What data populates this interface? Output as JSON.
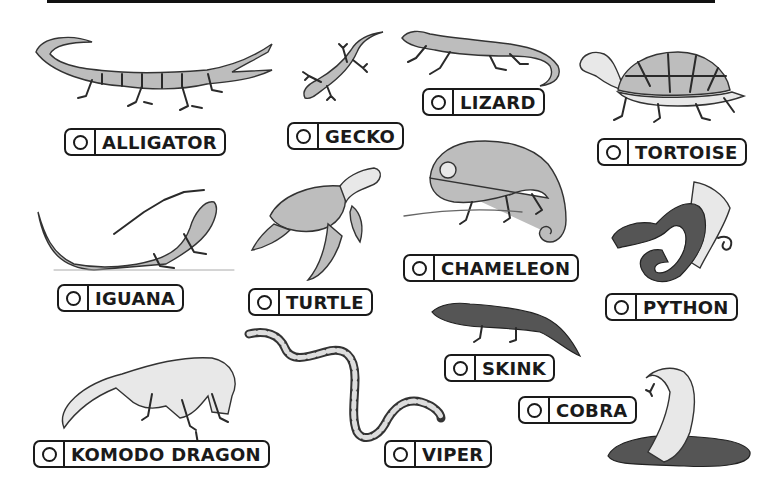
{
  "worksheet": {
    "labels": [
      {
        "id": "alligator",
        "text": "ALLIGATOR",
        "checked": false
      },
      {
        "id": "gecko",
        "text": "GECKO",
        "checked": false
      },
      {
        "id": "lizard",
        "text": "LIZARD",
        "checked": false
      },
      {
        "id": "tortoise",
        "text": "TORTOISE",
        "checked": false
      },
      {
        "id": "chameleon",
        "text": "CHAMELEON",
        "checked": false
      },
      {
        "id": "iguana",
        "text": "IGUANA",
        "checked": false
      },
      {
        "id": "turtle",
        "text": "TURTLE",
        "checked": false
      },
      {
        "id": "python",
        "text": "PYTHON",
        "checked": false
      },
      {
        "id": "skink",
        "text": "SKINK",
        "checked": false
      },
      {
        "id": "cobra",
        "text": "COBRA",
        "checked": false
      },
      {
        "id": "komodo-dragon",
        "text": "KOMODO DRAGON",
        "checked": false
      },
      {
        "id": "viper",
        "text": "VIPER",
        "checked": false
      }
    ],
    "illustrations": [
      "alligator",
      "gecko",
      "lizard",
      "tortoise",
      "iguana",
      "turtle",
      "chameleon",
      "python",
      "skink",
      "komodo-dragon",
      "viper",
      "cobra"
    ]
  }
}
